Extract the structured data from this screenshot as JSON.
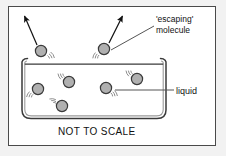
{
  "figure": {
    "caption": "NOT TO SCALE",
    "frame": {
      "border_color": "#4a4a4a",
      "background": "#ffffff"
    },
    "page_background": "#f2f2f2"
  },
  "labels": {
    "escaping_line1": "'escaping'",
    "escaping_line2": "molecule",
    "liquid": "liquid",
    "not_to_scale": "NOT TO SCALE"
  },
  "colors": {
    "molecule_fill": "#b0b0b0",
    "molecule_stroke": "#3a3a3a",
    "container_stroke": "#3a3a3a",
    "arrow_color": "#111111",
    "leader_color": "#555555",
    "motion_line": "#8d8d8d"
  },
  "diagram": {
    "container": {
      "name": "beaker",
      "left": 22,
      "right": 166,
      "rim_y": 62,
      "bottom_y": 118,
      "wall": "double-line with curled rim lips and rounded bottom corners"
    },
    "escaping_molecules": [
      {
        "id": "escaping-molecule-1",
        "cx": 41,
        "cy": 51,
        "r": 5.6,
        "arrow": {
          "x1": 37,
          "y1": 45,
          "x2": 24,
          "y2": 15
        }
      },
      {
        "id": "escaping-molecule-2",
        "cx": 104,
        "cy": 49,
        "r": 5.6,
        "arrow": {
          "x1": 109,
          "y1": 43,
          "x2": 122,
          "y2": 15
        }
      }
    ],
    "liquid_molecules": [
      {
        "id": "liquid-molecule-1",
        "cx": 38,
        "cy": 89,
        "r": 5.6
      },
      {
        "id": "liquid-molecule-2",
        "cx": 69,
        "cy": 82,
        "r": 5.6
      },
      {
        "id": "liquid-molecule-3",
        "cx": 62,
        "cy": 106,
        "r": 5.6
      },
      {
        "id": "liquid-molecule-4",
        "cx": 106,
        "cy": 88,
        "r": 5.6
      },
      {
        "id": "liquid-molecule-5",
        "cx": 137,
        "cy": 79,
        "r": 5.6
      }
    ],
    "leaders": [
      {
        "id": "leader-escaping",
        "x1": 111,
        "y1": 50,
        "x2": 154,
        "y2": 26
      },
      {
        "id": "leader-liquid",
        "x1": 115,
        "y1": 90,
        "x2": 174,
        "y2": 90
      }
    ]
  }
}
